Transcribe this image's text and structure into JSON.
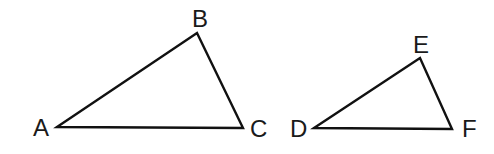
{
  "diagram": {
    "type": "geometry-similar-triangles",
    "stroke_color": "#111111",
    "label_color": "#1a1a1a",
    "background": "#ffffff",
    "triangles": [
      {
        "name": "ABC",
        "vertices": [
          {
            "label": "A",
            "x": 57,
            "y": 127,
            "label_x": 33,
            "label_y": 136
          },
          {
            "label": "B",
            "x": 197,
            "y": 33,
            "label_x": 192,
            "label_y": 27
          },
          {
            "label": "C",
            "x": 243,
            "y": 128,
            "label_x": 250,
            "label_y": 137
          }
        ]
      },
      {
        "name": "DEF",
        "vertices": [
          {
            "label": "D",
            "x": 314,
            "y": 128,
            "label_x": 290,
            "label_y": 137
          },
          {
            "label": "E",
            "x": 420,
            "y": 58,
            "label_x": 413,
            "label_y": 53
          },
          {
            "label": "F",
            "x": 452,
            "y": 129,
            "label_x": 462,
            "label_y": 137
          }
        ]
      }
    ]
  }
}
